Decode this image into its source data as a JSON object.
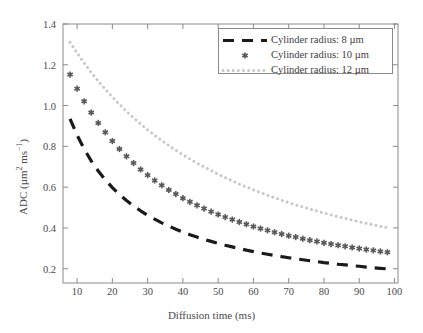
{
  "chart_data": {
    "type": "line",
    "title": "",
    "xlabel": "Diffusion time (ms)",
    "ylabel": "ADC (µm² ms⁻¹)",
    "xlim": [
      6,
      101
    ],
    "ylim": [
      0.13,
      1.4
    ],
    "grid": false,
    "legend_position": "top-right",
    "xticks": [
      10,
      20,
      30,
      40,
      50,
      60,
      70,
      80,
      90,
      100
    ],
    "xtick_labels": [
      "10",
      "20",
      "30",
      "40",
      "50",
      "60",
      "70",
      "80",
      "90",
      "100"
    ],
    "yticks": [
      0.2,
      0.4,
      0.6,
      0.8,
      1.0,
      1.2,
      1.4
    ],
    "ytick_labels": [
      "0.2",
      "0.4",
      "0.6",
      "0.8",
      "1.0",
      "1.2",
      "1.4"
    ],
    "series": [
      {
        "name": "Cylinder radius: 8 µm",
        "style": "dashed",
        "color": "#1a1a1a",
        "linewidth": 3.2,
        "marker": "none",
        "x": [
          8,
          10,
          12,
          14,
          16,
          18,
          20,
          22,
          24,
          26,
          28,
          30,
          32,
          34,
          36,
          38,
          40,
          42,
          44,
          46,
          48,
          50,
          52,
          54,
          56,
          58,
          60,
          62,
          64,
          66,
          68,
          70,
          72,
          74,
          76,
          78,
          80,
          82,
          84,
          86,
          88,
          90,
          92,
          94,
          96,
          98
        ],
        "y": [
          0.935,
          0.855,
          0.787,
          0.729,
          0.679,
          0.636,
          0.598,
          0.564,
          0.535,
          0.508,
          0.484,
          0.462,
          0.443,
          0.425,
          0.409,
          0.394,
          0.38,
          0.367,
          0.355,
          0.344,
          0.334,
          0.324,
          0.315,
          0.307,
          0.299,
          0.291,
          0.284,
          0.277,
          0.271,
          0.265,
          0.259,
          0.254,
          0.249,
          0.244,
          0.239,
          0.235,
          0.23,
          0.226,
          0.222,
          0.219,
          0.215,
          0.212,
          0.208,
          0.205,
          0.202,
          0.199
        ]
      },
      {
        "name": "Cylinder radius: 10 µm",
        "style": "markers",
        "color": "#585858",
        "linewidth": 0,
        "marker": "asterisk",
        "x": [
          8,
          10,
          12,
          14,
          16,
          18,
          20,
          22,
          24,
          26,
          28,
          30,
          32,
          34,
          36,
          38,
          40,
          42,
          44,
          46,
          48,
          50,
          52,
          54,
          56,
          58,
          60,
          62,
          64,
          66,
          68,
          70,
          72,
          74,
          76,
          78,
          80,
          82,
          84,
          86,
          88,
          90,
          92,
          94,
          96,
          98
        ],
        "y": [
          1.152,
          1.083,
          1.021,
          0.966,
          0.915,
          0.869,
          0.826,
          0.787,
          0.751,
          0.718,
          0.687,
          0.659,
          0.633,
          0.609,
          0.586,
          0.566,
          0.546,
          0.528,
          0.511,
          0.495,
          0.48,
          0.466,
          0.453,
          0.441,
          0.429,
          0.418,
          0.407,
          0.397,
          0.388,
          0.379,
          0.37,
          0.362,
          0.355,
          0.347,
          0.34,
          0.334,
          0.327,
          0.321,
          0.315,
          0.31,
          0.304,
          0.299,
          0.294,
          0.29,
          0.285,
          0.281
        ]
      },
      {
        "name": "Cylinder radius: 12 µm",
        "style": "dotted",
        "color": "#c9c9c9",
        "linewidth": 3.0,
        "marker": "none",
        "x": [
          8,
          10,
          12,
          14,
          16,
          18,
          20,
          22,
          24,
          26,
          28,
          30,
          32,
          34,
          36,
          38,
          40,
          42,
          44,
          46,
          48,
          50,
          52,
          54,
          56,
          58,
          60,
          62,
          64,
          66,
          68,
          70,
          72,
          74,
          76,
          78,
          80,
          82,
          84,
          86,
          88,
          90,
          92,
          94,
          96,
          98
        ],
        "y": [
          1.31,
          1.258,
          1.209,
          1.163,
          1.12,
          1.08,
          1.042,
          1.006,
          0.972,
          0.94,
          0.91,
          0.881,
          0.854,
          0.829,
          0.804,
          0.781,
          0.759,
          0.738,
          0.718,
          0.699,
          0.681,
          0.663,
          0.647,
          0.631,
          0.615,
          0.601,
          0.587,
          0.573,
          0.56,
          0.548,
          0.536,
          0.524,
          0.513,
          0.503,
          0.492,
          0.483,
          0.473,
          0.464,
          0.455,
          0.447,
          0.438,
          0.43,
          0.423,
          0.415,
          0.408,
          0.401
        ]
      }
    ]
  },
  "legend": {
    "items": [
      {
        "label": "Cylinder radius: 8 µm"
      },
      {
        "label": "Cylinder radius: 10 µm"
      },
      {
        "label": "Cylinder radius: 12 µm"
      }
    ]
  },
  "colors": {
    "axis": "#8a8a8a",
    "text": "#4a4a4a",
    "series_8um": "#1a1a1a",
    "series_10um": "#585858",
    "series_12um": "#c9c9c9",
    "background": "#ffffff"
  }
}
